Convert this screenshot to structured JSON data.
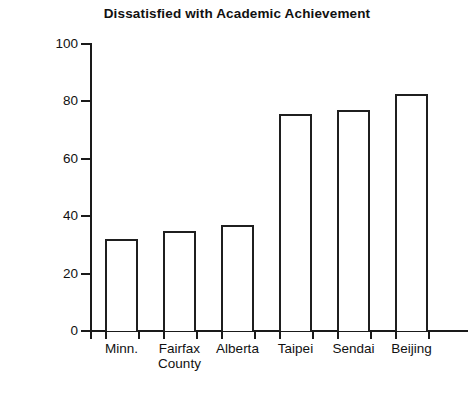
{
  "chart_data": {
    "type": "bar",
    "title": "Dissatisfied with Academic Achievement",
    "xlabel": "",
    "ylabel": "Percent of Students",
    "categories": [
      "Minn.",
      "Fairfax\nCounty",
      "Alberta",
      "Taipei",
      "Sendai",
      "Beijing"
    ],
    "values": [
      32,
      35,
      37,
      75.5,
      77,
      82.5
    ],
    "ylim": [
      0,
      100
    ],
    "yticks": [
      0,
      20,
      40,
      60,
      80,
      100
    ],
    "ytick_labels": [
      "0",
      "20",
      "40",
      "60",
      "80",
      "100"
    ],
    "grid": false,
    "legend": false,
    "bar_style": {
      "fill": "#ffffff",
      "edge": "#1f1f1f"
    }
  },
  "axis": {
    "line_color": "#1a1a1a"
  }
}
